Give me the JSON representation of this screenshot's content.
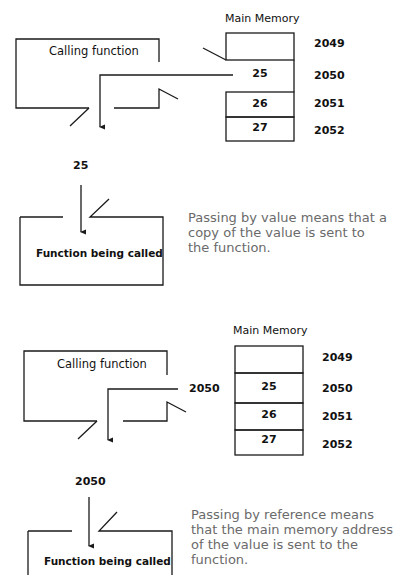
{
  "top_cut_text": "",
  "value_diagram": {
    "memory_title": "Main Memory",
    "calling_function_label": "Calling function",
    "called_function_label": "Function being called",
    "passed_value": "25",
    "pulled_out_cell_value": "25",
    "memory_cells": [
      {
        "value": "",
        "address": "2049"
      },
      {
        "value": "25",
        "address": "2050"
      },
      {
        "value": "26",
        "address": "2051"
      },
      {
        "value": "27",
        "address": "2052"
      }
    ],
    "caption": "Passing by value means that a copy of the value is sent to the function."
  },
  "reference_diagram": {
    "memory_title": "Main Memory",
    "calling_function_label": "Calling function",
    "called_function_label": "Function being called",
    "pointer_label": "2050",
    "passed_value": "2050",
    "memory_cells": [
      {
        "value": "",
        "address": "2049"
      },
      {
        "value": "25",
        "address": "2050"
      },
      {
        "value": "26",
        "address": "2051"
      },
      {
        "value": "27",
        "address": "2052"
      }
    ],
    "caption": "Passing by reference means that the main memory address of the value is sent to the function."
  },
  "colors": {
    "line": "#1a1a1a",
    "caption_text": "#6a6a6a"
  }
}
